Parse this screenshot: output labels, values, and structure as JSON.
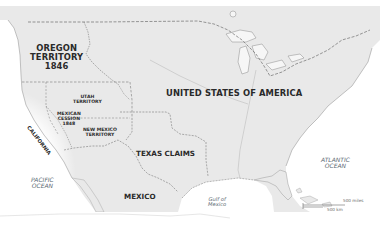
{
  "map": {
    "title": "United States territorial claims, 1846-1848",
    "colors": {
      "land": "#e9e9e9",
      "water": "#ffffff",
      "coast": "#9a9a9a",
      "border_dashed": "#7a7a7a",
      "label": "#2a2a2a",
      "water_label": "#5d6a74"
    },
    "regions": [
      {
        "id": "oregon",
        "lines": [
          "OREGON",
          "TERRITORY",
          "1846"
        ]
      },
      {
        "id": "utah",
        "lines": [
          "UTAH",
          "TERRITORY"
        ]
      },
      {
        "id": "mexican-cession",
        "lines": [
          "MEXICAN",
          "CESSION",
          "1848"
        ]
      },
      {
        "id": "new-mexico",
        "lines": [
          "NEW MEXICO",
          "TERRITORY"
        ]
      },
      {
        "id": "california",
        "lines": [
          "CALIFORNIA"
        ]
      },
      {
        "id": "usa",
        "lines": [
          "UNITED STATES OF AMERICA"
        ]
      },
      {
        "id": "texas",
        "lines": [
          "TEXAS CLAIMS"
        ]
      },
      {
        "id": "mexico",
        "lines": [
          "MEXICO"
        ]
      }
    ],
    "water_bodies": [
      {
        "id": "pacific",
        "lines": [
          "PACIFIC",
          "OCEAN"
        ]
      },
      {
        "id": "atlantic",
        "lines": [
          "ATLANTIC",
          "OCEAN"
        ]
      },
      {
        "id": "gulf",
        "lines": [
          "Gulf of",
          "Mexico"
        ]
      }
    ],
    "scale_bar": {
      "miles_label": "500 miles",
      "km_label": "500 km"
    }
  }
}
